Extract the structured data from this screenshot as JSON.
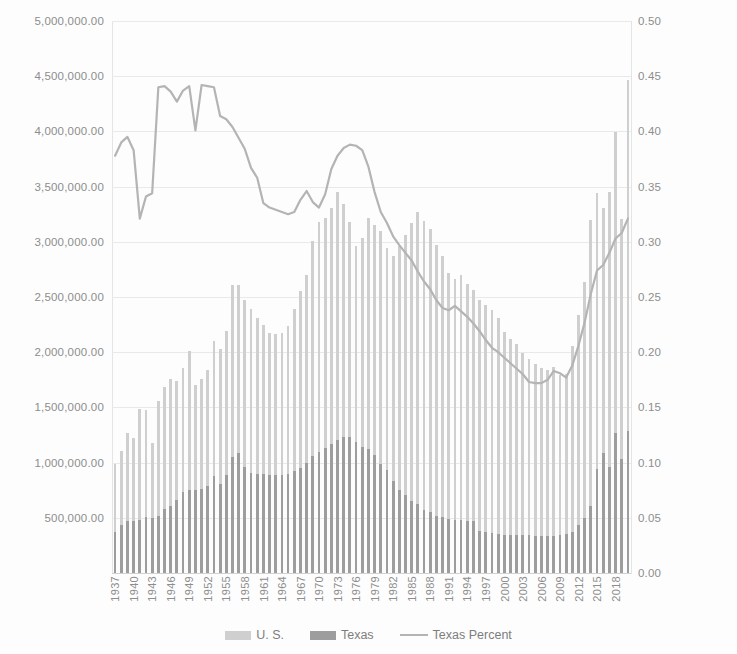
{
  "legend": {
    "items": [
      {
        "label": "U. S.",
        "marker": "bar-swatch-icon",
        "color": "#cfcfcf"
      },
      {
        "label": "Texas",
        "marker": "bar-swatch-icon",
        "color": "#9d9d9d"
      },
      {
        "label": "Texas Percent",
        "marker": "line-swatch-icon",
        "color": "#b4b4b4"
      }
    ]
  },
  "chart_data": {
    "type": "bar",
    "title": "",
    "subtitle": "",
    "xlabel": "",
    "ylabel": "",
    "y2label": "",
    "grid": true,
    "legend_position": "bottom",
    "ylim": [
      0,
      5000000
    ],
    "y2lim": [
      0,
      0.5
    ],
    "y_ticks": [
      "500,000.00",
      "1,000,000.00",
      "1,500,000.00",
      "2,000,000.00",
      "2,500,000.00",
      "3,000,000.00",
      "3,500,000.00",
      "4,000,000.00",
      "4,500,000.00",
      "5,000,000.00"
    ],
    "y_tick_values": [
      500000,
      1000000,
      1500000,
      2000000,
      2500000,
      3000000,
      3500000,
      4000000,
      4500000,
      5000000
    ],
    "y2_ticks": [
      "0.00",
      "0.05",
      "0.10",
      "0.15",
      "0.20",
      "0.25",
      "0.30",
      "0.35",
      "0.40",
      "0.45",
      "0.50"
    ],
    "y2_tick_values": [
      0.0,
      0.05,
      0.1,
      0.15,
      0.2,
      0.25,
      0.3,
      0.35,
      0.4,
      0.45,
      0.5
    ],
    "x_tick_labels": [
      "1937",
      "1940",
      "1943",
      "1946",
      "1949",
      "1952",
      "1955",
      "1958",
      "1961",
      "1964",
      "1967",
      "1970",
      "1973",
      "1976",
      "1979",
      "1982",
      "1985",
      "1988",
      "1991",
      "1994",
      "1997",
      "2000",
      "2003",
      "2006",
      "2009",
      "2012",
      "2015",
      "2018"
    ],
    "x": [
      1936,
      1937,
      1938,
      1939,
      1940,
      1941,
      1942,
      1943,
      1944,
      1945,
      1946,
      1947,
      1948,
      1949,
      1950,
      1951,
      1952,
      1953,
      1954,
      1955,
      1956,
      1957,
      1958,
      1959,
      1960,
      1961,
      1962,
      1963,
      1964,
      1965,
      1966,
      1967,
      1968,
      1969,
      1970,
      1971,
      1972,
      1973,
      1974,
      1975,
      1976,
      1977,
      1978,
      1979,
      1980,
      1981,
      1982,
      1983,
      1984,
      1985,
      1986,
      1987,
      1988,
      1989,
      1990,
      1991,
      1992,
      1993,
      1994,
      1995,
      1996,
      1997,
      1998,
      1999,
      2000,
      2001,
      2002,
      2003,
      2004,
      2005,
      2006,
      2007,
      2008,
      2009,
      2010,
      2011,
      2012,
      2013,
      2014,
      2015,
      2016,
      2017,
      2018,
      2019
    ],
    "series": [
      {
        "name": "U. S.",
        "axis": "left",
        "color": "#cfcfcf",
        "values": [
          985000,
          1105000,
          1265000,
          1225000,
          1490000,
          1480000,
          1180000,
          1560000,
          1685000,
          1760000,
          1735000,
          1855000,
          2015000,
          1705000,
          1760000,
          1835000,
          2105000,
          2030000,
          2195000,
          2610000,
          2610000,
          2470000,
          2395000,
          2310000,
          2250000,
          2175000,
          2165000,
          2175000,
          2240000,
          2390000,
          2550000,
          2700000,
          3010000,
          3175000,
          3215000,
          3310000,
          3450000,
          3340000,
          3175000,
          2965000,
          3035000,
          3215000,
          3155000,
          3095000,
          2940000,
          2870000,
          2960000,
          3065000,
          3170000,
          3270000,
          3190000,
          3120000,
          2970000,
          2870000,
          2720000,
          2660000,
          2700000,
          2620000,
          2565000,
          2470000,
          2425000,
          2380000,
          2310000,
          2180000,
          2120000,
          2070000,
          1995000,
          1935000,
          1890000,
          1855000,
          1835000,
          1865000,
          1790000,
          1805000,
          2060000,
          2340000,
          2640000,
          3195000,
          3445000,
          3310000,
          3450000,
          3995000,
          3205000,
          4470000
        ]
      },
      {
        "name": "Texas",
        "axis": "left",
        "color": "#9d9d9d",
        "values": [
          373000,
          437000,
          470000,
          470000,
          478000,
          504000,
          500000,
          520000,
          583000,
          610000,
          663000,
          735000,
          752000,
          752000,
          763000,
          790000,
          875000,
          810000,
          885000,
          1055000,
          1090000,
          960000,
          905000,
          900000,
          895000,
          890000,
          890000,
          885000,
          895000,
          920000,
          950000,
          1000000,
          1060000,
          1095000,
          1130000,
          1170000,
          1205000,
          1235000,
          1235000,
          1190000,
          1145000,
          1125000,
          1065000,
          985000,
          930000,
          830000,
          755000,
          710000,
          655000,
          625000,
          575000,
          555000,
          520000,
          505000,
          490000,
          480000,
          480000,
          475000,
          470000,
          380000,
          370000,
          360000,
          355000,
          340000,
          340000,
          345000,
          340000,
          340000,
          335000,
          335000,
          335000,
          335000,
          345000,
          355000,
          370000,
          435000,
          500000,
          610000,
          940000,
          1085000,
          960000,
          1270000,
          1030000,
          1285000
        ]
      },
      {
        "name": "Texas Percent",
        "axis": "right",
        "color": "#b4b4b4",
        "values": [
          0.378,
          0.39,
          0.395,
          0.383,
          0.321,
          0.341,
          0.344,
          0.44,
          0.441,
          0.436,
          0.427,
          0.437,
          0.441,
          0.401,
          0.442,
          0.441,
          0.44,
          0.414,
          0.411,
          0.404,
          0.394,
          0.384,
          0.367,
          0.358,
          0.335,
          0.331,
          0.329,
          0.327,
          0.325,
          0.327,
          0.338,
          0.346,
          0.336,
          0.331,
          0.343,
          0.366,
          0.378,
          0.385,
          0.388,
          0.387,
          0.383,
          0.368,
          0.345,
          0.327,
          0.317,
          0.305,
          0.297,
          0.29,
          0.283,
          0.273,
          0.264,
          0.257,
          0.247,
          0.24,
          0.238,
          0.242,
          0.237,
          0.232,
          0.226,
          0.219,
          0.211,
          0.204,
          0.2,
          0.195,
          0.19,
          0.185,
          0.18,
          0.173,
          0.172,
          0.172,
          0.175,
          0.183,
          0.181,
          0.177,
          0.188,
          0.206,
          0.227,
          0.253,
          0.274,
          0.279,
          0.29,
          0.303,
          0.308,
          0.321
        ]
      }
    ]
  }
}
